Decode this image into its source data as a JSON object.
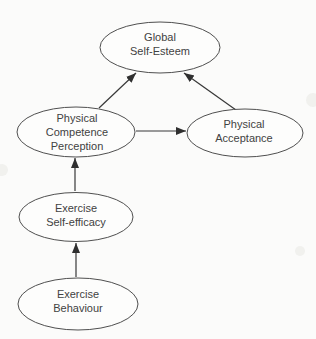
{
  "canvas": {
    "background_color": "#fbfbfa",
    "ink_color": "#424242",
    "arrow_color": "#2f2f2f"
  },
  "diagram": {
    "type": "path-model",
    "nodes": [
      {
        "id": "global-self-esteem",
        "lines": [
          "Global",
          "Self-Esteem"
        ]
      },
      {
        "id": "physical-competence-perception",
        "lines": [
          "Physical",
          "Competence",
          "Perception"
        ]
      },
      {
        "id": "physical-acceptance",
        "lines": [
          "Physical",
          "Acceptance"
        ]
      },
      {
        "id": "exercise-self-efficacy",
        "lines": [
          "Exercise",
          "Self-efficacy"
        ]
      },
      {
        "id": "exercise-behaviour",
        "lines": [
          "Exercise",
          "Behaviour"
        ]
      }
    ],
    "edges": [
      {
        "from": "exercise-behaviour",
        "to": "exercise-self-efficacy"
      },
      {
        "from": "exercise-self-efficacy",
        "to": "physical-competence-perception"
      },
      {
        "from": "physical-competence-perception",
        "to": "physical-acceptance"
      },
      {
        "from": "physical-competence-perception",
        "to": "global-self-esteem"
      },
      {
        "from": "physical-acceptance",
        "to": "global-self-esteem"
      }
    ]
  }
}
